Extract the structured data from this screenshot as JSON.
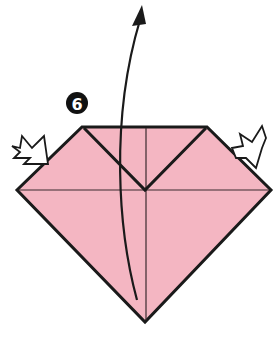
{
  "diagram": {
    "type": "origami-step",
    "step_number": "6",
    "colors": {
      "paper": "#f4b6c2",
      "outline": "#1a1a1a",
      "push_arrow_fill": "#ffffff",
      "step_badge": "#111111"
    },
    "paper_outline": "82,127 207,127 271,190 145,322 17,190",
    "back_layer_outline": "84,130 205,130 266,191 145,318 21,191",
    "inner_fold_v": "84,128 145,190 206,128",
    "horizontal_crease": {
      "x1": 19,
      "y1": 190,
      "x2": 269,
      "y2": 190
    },
    "vertical_crease": {
      "x1": 146,
      "y1": 128,
      "x2": 146,
      "y2": 320
    },
    "flip_arrow": {
      "path": "M137,300 C118,230 110,120 140,20",
      "head": "142,5 132,26 146,24"
    },
    "push_arrow_left": "12,146 20,148 22,136 32,148 44,136 48,164 24,164 30,158 14,158 20,152",
    "push_arrow_right": "232,148 243,146 240,134 252,142 262,126 266,138 262,148 256,168 246,158 236,158",
    "step_badge": {
      "cx": 77,
      "cy": 103,
      "r": 11,
      "label": "6"
    }
  }
}
